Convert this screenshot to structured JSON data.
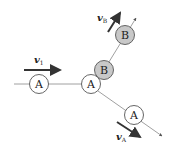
{
  "diagram": {
    "title": "",
    "colors": {
      "line": "#888888",
      "circle_stroke": "#555555",
      "circle_a_fill": "#ffffff",
      "circle_b_fill": "#c8c8c8",
      "arrow": "#333333",
      "text": "#222222"
    },
    "particles": [
      {
        "id": "A-initial",
        "label": "A",
        "cx": 39,
        "cy": 84,
        "r": 9.5
      },
      {
        "id": "A-collision",
        "label": "A",
        "cx": 91,
        "cy": 84,
        "r": 9.5
      },
      {
        "id": "B-collision",
        "label": "B",
        "cx": 104,
        "cy": 70,
        "r": 9.5
      },
      {
        "id": "B-final",
        "label": "B",
        "cx": 125,
        "cy": 35,
        "r": 9.5
      },
      {
        "id": "A-final",
        "label": "A",
        "cx": 134,
        "cy": 115,
        "r": 9.5
      }
    ],
    "velocity_labels": {
      "v1": {
        "main": "v",
        "sub": "1"
      },
      "vB": {
        "main": "v",
        "sub": "B"
      },
      "vA": {
        "main": "v",
        "sub": "A"
      }
    }
  }
}
